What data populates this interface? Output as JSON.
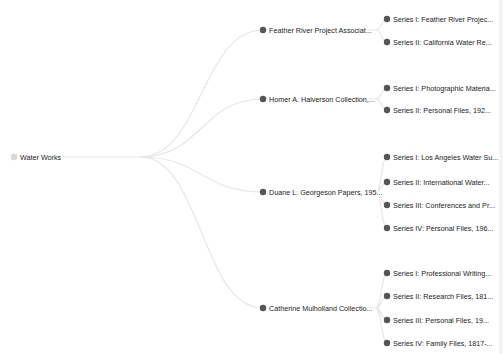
{
  "colors": {
    "background": "#ffffff",
    "link": "#e6e6e6",
    "node_fill": "#555555",
    "root_fill": "#d9d9d9",
    "label": "#222222"
  },
  "tree": {
    "root": {
      "label": "Water Works",
      "x": 14,
      "y": 157,
      "label_end": 140
    },
    "children": [
      {
        "label": "Feather River Project Associat...",
        "x": 263,
        "y": 30,
        "label_end": 376,
        "children": [
          {
            "label": "Series I: Feather River Projec...",
            "x": 387,
            "y": 19
          },
          {
            "label": "Series II: California Water Re...",
            "x": 387,
            "y": 42
          }
        ]
      },
      {
        "label": "Homer A. Halverson Collection,...",
        "x": 263,
        "y": 99,
        "label_end": 376,
        "children": [
          {
            "label": "Series I: Photographic Materia...",
            "x": 387,
            "y": 88
          },
          {
            "label": "Series II: Personal Files, 192...",
            "x": 387,
            "y": 110
          }
        ]
      },
      {
        "label": "Duane L. Georgeson Papers, 195...",
        "x": 263,
        "y": 192,
        "label_end": 376,
        "children": [
          {
            "label": "Series I: Los Angeles Water Su...",
            "x": 387,
            "y": 157
          },
          {
            "label": "Series II: International Water...",
            "x": 387,
            "y": 182
          },
          {
            "label": "Series III: Conferences and Pr...",
            "x": 387,
            "y": 205
          },
          {
            "label": "Series IV: Personal Files, 196...",
            "x": 387,
            "y": 228
          }
        ]
      },
      {
        "label": "Catherine Mulholland Collectio...",
        "x": 263,
        "y": 308,
        "label_end": 376,
        "children": [
          {
            "label": "Series I: Professional Writing...",
            "x": 387,
            "y": 273
          },
          {
            "label": "Series II: Research Files, 181...",
            "x": 387,
            "y": 296
          },
          {
            "label": "Series III: Personal Files, 19...",
            "x": 387,
            "y": 320
          },
          {
            "label": "Series IV: Family Files, 1817-...",
            "x": 387,
            "y": 343
          }
        ]
      }
    ]
  }
}
